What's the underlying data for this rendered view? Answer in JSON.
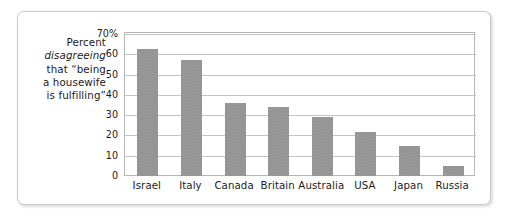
{
  "caption": {
    "line1": "Percent",
    "line2_italic": "disagreeing",
    "line3": "that “being",
    "line4": "a housewife",
    "line5": "is fulfilling”"
  },
  "colors": {
    "bar_fill": "#8e8e8e",
    "gridline": "#c4c4c4",
    "plot_border": "#b6b6b6",
    "outer_frame": "#c9c9c9",
    "text": "#1b1b1b"
  },
  "chart_data": {
    "type": "bar",
    "title": "",
    "xlabel": "",
    "ylabel": "Percent disagreeing that “being a housewife is fulfilling”",
    "categories": [
      "Israel",
      "Italy",
      "Canada",
      "Britain",
      "Australia",
      "USA",
      "Japan",
      "Russia"
    ],
    "values": [
      62.5,
      57,
      36,
      34,
      29,
      21.5,
      15,
      5
    ],
    "ylim": [
      0,
      70
    ],
    "yticks": [
      0,
      10,
      20,
      30,
      40,
      50,
      60,
      70
    ],
    "ytick_labels": [
      "0",
      "10",
      "20",
      "30",
      "40",
      "50",
      "60",
      "70%"
    ],
    "grid": true,
    "legend": "none",
    "orientation": "vertical"
  }
}
